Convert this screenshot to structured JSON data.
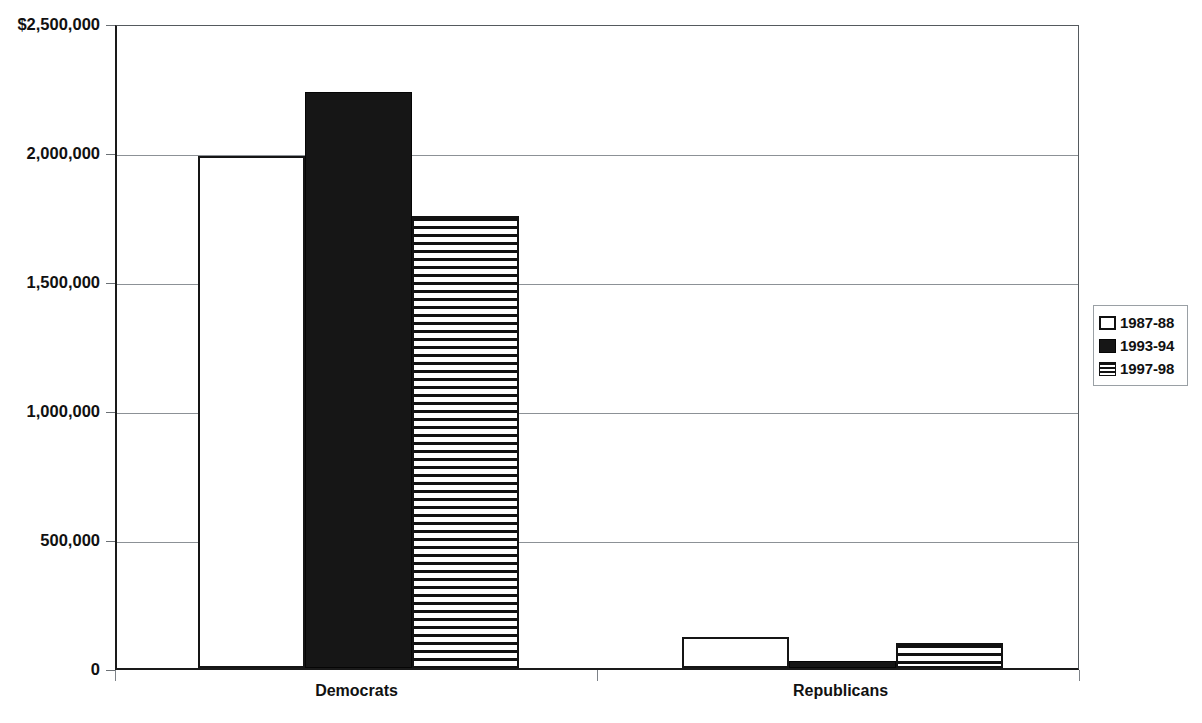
{
  "chart_data": {
    "type": "bar",
    "title": "",
    "xlabel": "",
    "ylabel": "",
    "categories": [
      "Democrats",
      "Republicans"
    ],
    "series": [
      {
        "name": "1987-88",
        "pattern": "open",
        "values": [
          1985000,
          120000
        ]
      },
      {
        "name": "1993-94",
        "pattern": "solid",
        "values": [
          2232000,
          28000
        ]
      },
      {
        "name": "1997-98",
        "pattern": "hatch",
        "values": [
          1753000,
          98000
        ]
      }
    ],
    "ylim": [
      0,
      2500000
    ],
    "y_ticks": [
      0,
      500000,
      1000000,
      1500000,
      2000000,
      2500000
    ],
    "y_tick_labels": [
      "0",
      "500,000",
      "1,000,000",
      "1,500,000",
      "2,000,000",
      "$2,500,000"
    ],
    "grid": true,
    "legend_position": "right",
    "colors": {
      "axis": "#1a1a1a",
      "gridline": "#8c9196",
      "bar_solid": "#161616",
      "bar_outline": "#111111",
      "background": "#ffffff",
      "text": "#111111"
    }
  },
  "axis": {
    "y_labels": [
      {
        "text": "$2,500,000",
        "value": 2500000
      },
      {
        "text": "2,000,000",
        "value": 2000000
      },
      {
        "text": "1,500,000",
        "value": 1500000
      },
      {
        "text": "1,000,000",
        "value": 1000000
      },
      {
        "text": "500,000",
        "value": 500000
      },
      {
        "text": "0",
        "value": 0
      }
    ],
    "x_labels": [
      "Democrats",
      "Republicans"
    ]
  },
  "legend": {
    "items": [
      {
        "label": "1987-88",
        "pattern": "open"
      },
      {
        "label": "1993-94",
        "pattern": "solid"
      },
      {
        "label": "1997-98",
        "pattern": "hatch"
      }
    ]
  }
}
